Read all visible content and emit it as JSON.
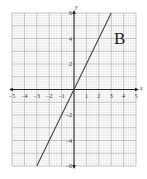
{
  "chart_data": {
    "type": "line",
    "title": "",
    "label": "B",
    "xlabel": "x",
    "ylabel": "y",
    "xlim": [
      -5,
      5
    ],
    "ylim": [
      -6,
      6
    ],
    "grid": true,
    "x_ticks": [
      "-5",
      "-4",
      "-3",
      "-2",
      "-1",
      "1",
      "2",
      "3",
      "4",
      "5"
    ],
    "y_ticks": [
      "6",
      "4",
      "2",
      "-2",
      "-4",
      "-6"
    ],
    "series": [
      {
        "name": "B",
        "equation": "y = 2x",
        "x": [
          -3,
          0,
          3
        ],
        "y": [
          -6,
          0,
          6
        ]
      }
    ]
  },
  "colors": {
    "grid_minor": "#d8d8d8",
    "grid_major": "#aaaaaa",
    "axis": "#222222",
    "line": "#444444"
  }
}
